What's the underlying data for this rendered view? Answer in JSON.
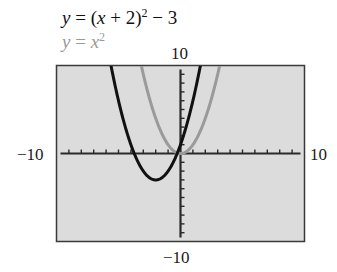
{
  "chart_data": {
    "type": "line",
    "title": "",
    "legend": [
      {
        "label": "y = (x + 2)^2 − 3",
        "color": "#111111"
      },
      {
        "label": "y = x^2",
        "color": "#9a9a9a"
      }
    ],
    "window": {
      "xmin": -10,
      "xmax": 10,
      "ymin": -10,
      "ymax": 10,
      "xscl": 1,
      "yscl": 1
    },
    "axis_labels": {
      "xmin": "−10",
      "xmax": "10",
      "ymin": "−10",
      "ymax": "10"
    },
    "grid": false,
    "background": "#dcdcdc",
    "series": [
      {
        "name": "y = (x + 2)^2 − 3",
        "function": "(x+2)^2-3",
        "color": "#111111",
        "vertex": [
          -2,
          -3
        ],
        "x": [
          -5.6,
          -5,
          -4,
          -3,
          -2,
          -1,
          0,
          1,
          1.6
        ],
        "values": [
          10,
          6,
          1,
          -2,
          -3,
          -2,
          1,
          6,
          10
        ]
      },
      {
        "name": "y = x^2",
        "function": "x^2",
        "color": "#9a9a9a",
        "vertex": [
          0,
          0
        ],
        "x": [
          -3.16,
          -3,
          -2,
          -1,
          0,
          1,
          2,
          3,
          3.16
        ],
        "values": [
          10,
          9,
          4,
          1,
          0,
          1,
          4,
          9,
          10
        ]
      }
    ]
  },
  "equations": {
    "eq1": {
      "lhs": "y",
      "eq": " = (",
      "var": "x",
      "rest": " + 2)",
      "exp": "2",
      "tail": " − 3"
    },
    "eq2": {
      "lhs": "y",
      "eq": " = ",
      "var": "x",
      "exp": "2"
    }
  },
  "labels": {
    "ymax": "10",
    "ymin": "−10",
    "xmin": "−10",
    "xmax": "10"
  }
}
